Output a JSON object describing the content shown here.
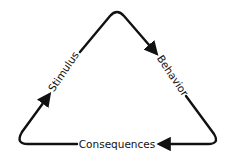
{
  "diagram": {
    "type": "cycle",
    "shape": "triangle",
    "nodes": [
      {
        "id": "stimulus",
        "label": "Stimulus"
      },
      {
        "id": "behavior",
        "label": "Behavior"
      },
      {
        "id": "consequences",
        "label": "Consequences"
      }
    ],
    "edges": [
      {
        "from": "stimulus",
        "to": "behavior"
      },
      {
        "from": "behavior",
        "to": "consequences"
      },
      {
        "from": "consequences",
        "to": "stimulus"
      }
    ],
    "colors": {
      "line": "#111111",
      "background": "#ffffff"
    }
  }
}
